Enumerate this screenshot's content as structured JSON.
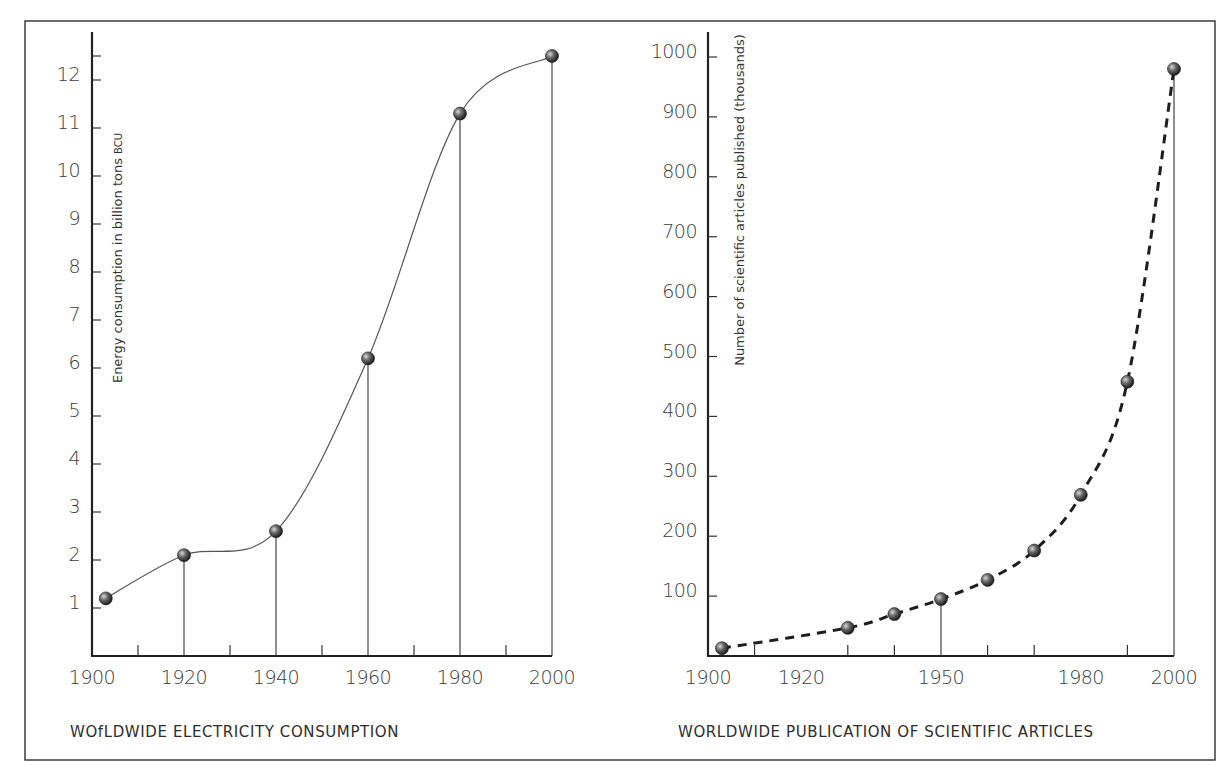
{
  "chart_data": [
    {
      "type": "line",
      "title": "WOfLDWIDE ELECTRICITY CONSUMPTION",
      "xlabel": "",
      "ylabel": "Energy consumption in billion tons BCU",
      "ylabel_main": "Energy consumption in billion tons",
      "ylabel_unit": "BCU",
      "x": [
        1903,
        1920,
        1940,
        1960,
        1980,
        2000
      ],
      "values": [
        1.2,
        2.1,
        2.6,
        6.2,
        11.3,
        12.5
      ],
      "drop_lines_at": [
        1920,
        1940,
        1960,
        1980,
        2000
      ],
      "line_style": "solid-smooth",
      "xlim": [
        1900,
        2000
      ],
      "ylim": [
        0,
        12.5
      ],
      "x_tick_labels": [
        "1900",
        "1920",
        "1940",
        "1960",
        "1980",
        "2000"
      ],
      "x_tick_values": [
        1900,
        1920,
        1940,
        1960,
        1980,
        2000
      ],
      "x_minor_ticks": [
        1910,
        1930,
        1950,
        1970,
        1990
      ],
      "y_tick_labels": [
        "1",
        "2",
        "3",
        "4",
        "5",
        "6",
        "7",
        "8",
        "9",
        "10",
        "11",
        "12"
      ],
      "y_tick_values": [
        1,
        2,
        3,
        4,
        5,
        6,
        7,
        8,
        9,
        10,
        11,
        12
      ],
      "y_extra_ticks": [
        12.5
      ],
      "grid": false,
      "legend": null
    },
    {
      "type": "line",
      "title": "WORLDWIDE PUBLICATION OF SCIENTIFIC ARTICLES",
      "xlabel": "",
      "ylabel": "Number of scientific articles published (thousands)",
      "x": [
        1903,
        1930,
        1940,
        1950,
        1960,
        1970,
        1980,
        1990,
        2000
      ],
      "values": [
        13,
        47,
        70,
        95,
        127,
        176,
        269,
        458,
        980
      ],
      "drop_lines_at": [
        1950,
        2000
      ],
      "line_style": "dashed-smooth",
      "xlim": [
        1900,
        2000
      ],
      "ylim": [
        0,
        1000
      ],
      "x_tick_labels": [
        "1900",
        "1920",
        "1950",
        "1980",
        "2000"
      ],
      "x_tick_values": [
        1900,
        1920,
        1950,
        1980,
        2000
      ],
      "x_minor_ticks": [
        1910,
        1930,
        1940,
        1960,
        1970,
        1990
      ],
      "y_tick_labels": [
        "100",
        "200",
        "300",
        "400",
        "500",
        "600",
        "700",
        "800",
        "900",
        "1000"
      ],
      "y_tick_values": [
        100,
        200,
        300,
        400,
        500,
        600,
        700,
        800,
        900,
        1000
      ],
      "grid": false,
      "legend": null
    }
  ],
  "colors": {
    "ink": "#2a2a2a",
    "border": "#3c3c3c",
    "marker_dark": "#2b2b2b",
    "marker_light": "#bdbdbd",
    "background": "#ffffff"
  }
}
